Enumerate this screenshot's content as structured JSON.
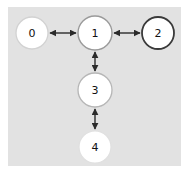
{
  "figure": {
    "title": "",
    "background_color": "#ffffff",
    "plot_background_color": "#e2e2e2"
  },
  "chart_data": {
    "type": "diagram",
    "diagram_kind": "node-link-graph",
    "title": "",
    "directed": true,
    "bidirectional_edges": true,
    "nodes": [
      {
        "id": "0",
        "label": "0",
        "x": 32,
        "y": 33,
        "r": 16,
        "fill": "#ffffff",
        "border_color": "#d2d2d2",
        "border_width": 1.3
      },
      {
        "id": "1",
        "label": "1",
        "x": 95,
        "y": 33,
        "r": 17,
        "fill": "#ffffff",
        "border_color": "#9a9a9a",
        "border_width": 1.4
      },
      {
        "id": "2",
        "label": "2",
        "x": 158,
        "y": 33,
        "r": 16,
        "fill": "#ffffff",
        "border_color": "#3a3a3a",
        "border_width": 1.8
      },
      {
        "id": "3",
        "label": "3",
        "x": 95,
        "y": 90,
        "r": 17,
        "fill": "#ffffff",
        "border_color": "#b6b6b6",
        "border_width": 1.3
      },
      {
        "id": "4",
        "label": "4",
        "x": 95,
        "y": 147,
        "r": 16,
        "fill": "#ffffff",
        "border_color": "#e0e0e0",
        "border_width": 1.2
      }
    ],
    "edges": [
      {
        "id": "edge-0-1",
        "source": "0",
        "target": "1",
        "arrow_start": true,
        "arrow_end": true,
        "color": "#2b2b2b",
        "width": 1.4
      },
      {
        "id": "edge-1-2",
        "source": "1",
        "target": "2",
        "arrow_start": true,
        "arrow_end": true,
        "color": "#2b2b2b",
        "width": 1.4
      },
      {
        "id": "edge-1-3",
        "source": "1",
        "target": "3",
        "arrow_start": true,
        "arrow_end": true,
        "color": "#2b2b2b",
        "width": 1.4
      },
      {
        "id": "edge-3-4",
        "source": "3",
        "target": "4",
        "arrow_start": true,
        "arrow_end": true,
        "color": "#2b2b2b",
        "width": 1.4
      }
    ],
    "node_count": 5,
    "edge_count": 4,
    "xlabel": "",
    "ylabel": "",
    "legend": [],
    "grid": false
  }
}
